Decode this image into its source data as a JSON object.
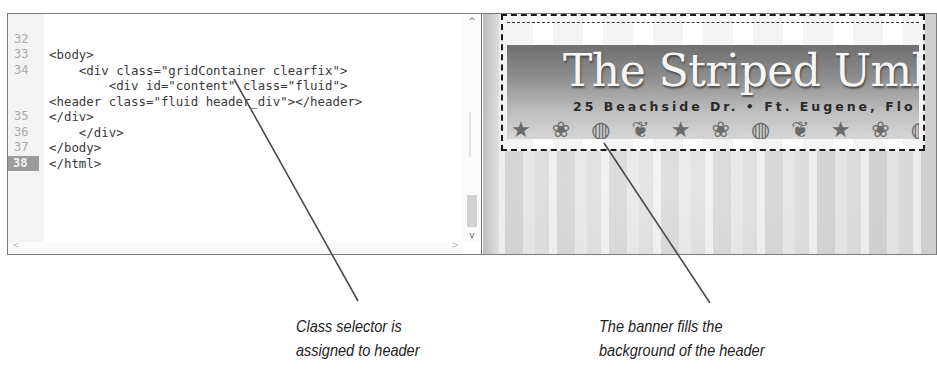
{
  "code_editor": {
    "lines": [
      {
        "number": "32",
        "text": "<body>",
        "active": false
      },
      {
        "number": "33",
        "text": "    <div class=\"gridContainer clearfix\">",
        "active": false
      },
      {
        "number": "34",
        "text": "        <div id=\"content\" class=\"fluid\">",
        "active": false
      },
      {
        "number": "",
        "text": "<header class=\"fluid header_div\"></header>",
        "active": false
      },
      {
        "number": "",
        "text": "</div>",
        "active": false
      },
      {
        "number": "35",
        "text": "    </div>",
        "active": false
      },
      {
        "number": "36",
        "text": "</body>",
        "active": false
      },
      {
        "number": "37",
        "text": "</html>",
        "active": false
      },
      {
        "number": "38",
        "text": "",
        "active": true
      }
    ],
    "scroll_up_icon": "^",
    "scroll_down_icon": "v",
    "scroll_left_icon": "<",
    "scroll_right_icon": ">"
  },
  "preview": {
    "banner_title": "The Striped Uml",
    "banner_address": "25 Beachside Dr. • Ft. Eugene, Flo",
    "shells": [
      "★",
      "❀",
      "◍",
      "❦",
      "★",
      "❀",
      "◍",
      "❦",
      "★",
      "❀",
      "◍"
    ]
  },
  "callouts": {
    "left": {
      "line1": "Class selector is",
      "line2": "assigned to header"
    },
    "right": {
      "line1": "The banner fills the",
      "line2": "background of the header"
    }
  },
  "colors": {
    "border": "#7a7a7a",
    "gutter": "#f3f3f3",
    "active_line_number_bg": "#9b9b9b",
    "code_text": "#3a3a3a",
    "leader_line": "#4a4a4a"
  }
}
